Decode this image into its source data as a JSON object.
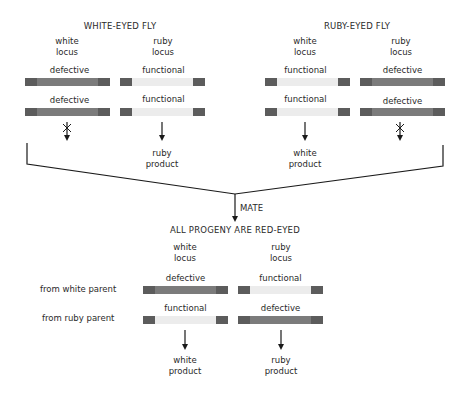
{
  "parents": {
    "white_eyed": {
      "title": "WHITE-EYED FLY",
      "white_locus_label": "white\nlocus",
      "ruby_locus_label": "ruby\nlocus",
      "white_alleles": [
        "defective",
        "defective"
      ],
      "ruby_alleles": [
        "functional",
        "functional"
      ],
      "product": "ruby\nproduct"
    },
    "ruby_eyed": {
      "title": "RUBY-EYED FLY",
      "white_locus_label": "white\nlocus",
      "ruby_locus_label": "ruby\nlocus",
      "white_alleles": [
        "functional",
        "functional"
      ],
      "ruby_alleles": [
        "defective",
        "defective"
      ],
      "product": "white\nproduct"
    }
  },
  "cross": {
    "label": "MATE"
  },
  "progeny": {
    "title": "ALL PROGENY ARE RED-EYED",
    "white_locus_label": "white\nlocus",
    "ruby_locus_label": "ruby\nlocus",
    "row_labels": [
      "from white parent",
      "from ruby parent"
    ],
    "white_alleles": [
      "defective",
      "functional"
    ],
    "ruby_alleles": [
      "functional",
      "defective"
    ],
    "white_product": "white\nproduct",
    "ruby_product": "ruby\nproduct"
  },
  "colors": {
    "defective_bar": "#7b7b7b",
    "functional_bar": "#ececec",
    "bar_caps": "#5c5c5c",
    "line": "#1a1a1a"
  }
}
